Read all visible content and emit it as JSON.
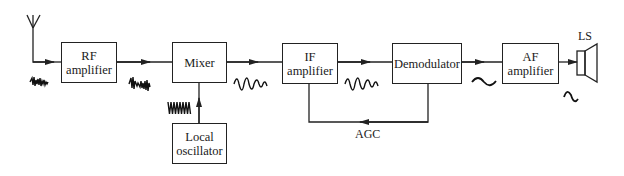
{
  "diagram": {
    "blocks": {
      "rf": {
        "line1": "RF",
        "line2": "amplifier"
      },
      "mixer": {
        "line1": "Mixer"
      },
      "local_osc": {
        "line1": "Local",
        "line2": "oscillator"
      },
      "if": {
        "line1": "IF",
        "line2": "amplifier"
      },
      "demod": {
        "line1": "Demodulator"
      },
      "af": {
        "line1": "AF",
        "line2": "amplifier"
      }
    },
    "labels": {
      "agc": "AGC",
      "loudspeaker": "LS"
    },
    "signals": [
      "rf-noisy-signal",
      "amplified-rf-signal",
      "local-oscillator-signal",
      "if-signal",
      "amplified-if-signal",
      "audio-signal",
      "amplified-audio-signal"
    ],
    "colors": {
      "line": "#222222",
      "background": "#ffffff"
    }
  }
}
